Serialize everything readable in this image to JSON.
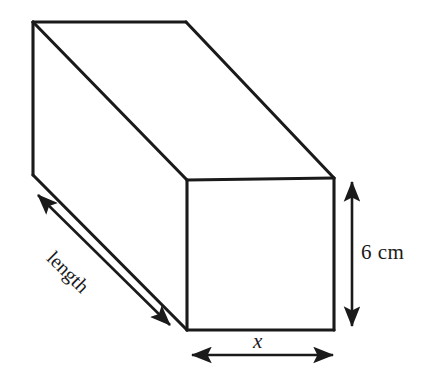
{
  "figure": {
    "kind": "cuboid-diagram",
    "background_color": "#ffffff",
    "stroke_color": "#1a1a1a",
    "canvas": {
      "width": 428,
      "height": 370
    }
  },
  "labels": {
    "height": "6 cm",
    "width": "x",
    "length": "length"
  },
  "annotations": {
    "height_dimension": {
      "name": "height-dimension-arrow",
      "text": "6 cm",
      "orientation": "vertical",
      "double_headed": true
    },
    "width_dimension": {
      "name": "width-dimension-arrow",
      "text": "x",
      "orientation": "horizontal",
      "double_headed": true
    },
    "length_dimension": {
      "name": "length-dimension-arrow",
      "text": "length",
      "orientation": "diagonal",
      "double_headed": true
    }
  },
  "geometry": {
    "back_top_left": [
      33,
      22
    ],
    "back_top_right": [
      186,
      22
    ],
    "back_bottom_left": [
      33,
      175
    ],
    "front_top_left": [
      187,
      180
    ],
    "front_top_right": [
      334,
      178
    ],
    "front_bottom_left": [
      187,
      330
    ],
    "front_bottom_right": [
      334,
      330
    ]
  }
}
